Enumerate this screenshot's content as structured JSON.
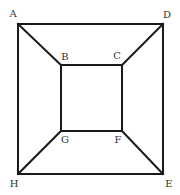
{
  "diagram": {
    "type": "geometric-figure",
    "vertices": [
      {
        "id": "A",
        "label": "A",
        "role": "outer",
        "position": "top-left"
      },
      {
        "id": "D",
        "label": "D",
        "role": "outer",
        "position": "top-right"
      },
      {
        "id": "E",
        "label": "E",
        "role": "outer",
        "position": "bottom-right"
      },
      {
        "id": "H",
        "label": "H",
        "role": "outer",
        "position": "bottom-left"
      },
      {
        "id": "B",
        "label": "B",
        "role": "inner",
        "position": "top-left"
      },
      {
        "id": "C",
        "label": "C",
        "role": "inner",
        "position": "top-right"
      },
      {
        "id": "F",
        "label": "F",
        "role": "inner",
        "position": "bottom-right"
      },
      {
        "id": "G",
        "label": "G",
        "role": "inner",
        "position": "bottom-left"
      }
    ],
    "edges": [
      [
        "A",
        "D"
      ],
      [
        "D",
        "E"
      ],
      [
        "E",
        "H"
      ],
      [
        "H",
        "A"
      ],
      [
        "B",
        "C"
      ],
      [
        "C",
        "F"
      ],
      [
        "F",
        "G"
      ],
      [
        "G",
        "B"
      ],
      [
        "A",
        "B"
      ],
      [
        "D",
        "C"
      ],
      [
        "E",
        "F"
      ],
      [
        "H",
        "G"
      ]
    ],
    "colors": {
      "line": "#1a1a1a",
      "label": "#333333",
      "background": "#ffffff"
    }
  }
}
